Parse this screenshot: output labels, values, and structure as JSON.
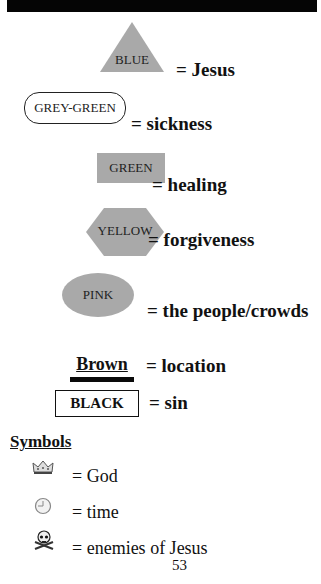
{
  "header": {
    "bar_color": "#050505"
  },
  "color_key": [
    {
      "shape": "triangle",
      "label": "BLUE",
      "meaning": "= Jesus",
      "fill": "#a9a9a9"
    },
    {
      "shape": "rounded-rectangle",
      "label": "GREY-GREEN",
      "meaning": "= sickness",
      "fill": "#ffffff"
    },
    {
      "shape": "rectangle",
      "label": "GREEN",
      "meaning": "= healing",
      "fill": "#a9a9a9"
    },
    {
      "shape": "hexagon",
      "label": "YELLOW",
      "meaning": "= forgiveness",
      "fill": "#a9a9a9"
    },
    {
      "shape": "ellipse",
      "label": "PINK",
      "meaning": "= the people/crowds",
      "fill": "#a9a9a9"
    },
    {
      "shape": "underline-bar",
      "label": "Brown",
      "meaning": "= location"
    },
    {
      "shape": "outlined-box",
      "label": "BLACK",
      "meaning": "= sin"
    }
  ],
  "symbols": {
    "heading": "Symbols",
    "items": [
      {
        "icon": "crown-icon",
        "meaning": "= God"
      },
      {
        "icon": "clock-icon",
        "meaning": "= time"
      },
      {
        "icon": "skull-crossbones-icon",
        "meaning": "= enemies of Jesus"
      }
    ]
  },
  "page_number": "53"
}
